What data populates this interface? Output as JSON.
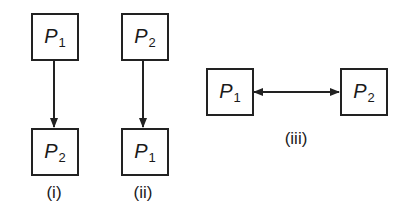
{
  "diagrams": [
    {
      "caption": "(i)",
      "top": {
        "name": "P",
        "sub": "1"
      },
      "bottom": {
        "name": "P",
        "sub": "2"
      },
      "arrow": "down"
    },
    {
      "caption": "(ii)",
      "top": {
        "name": "P",
        "sub": "2"
      },
      "bottom": {
        "name": "P",
        "sub": "1"
      },
      "arrow": "down"
    },
    {
      "caption": "(iii)",
      "left": {
        "name": "P",
        "sub": "1"
      },
      "right": {
        "name": "P",
        "sub": "2"
      },
      "arrow": "bidirectional"
    }
  ],
  "colors": {
    "stroke": "#222222",
    "background": "#ffffff"
  }
}
